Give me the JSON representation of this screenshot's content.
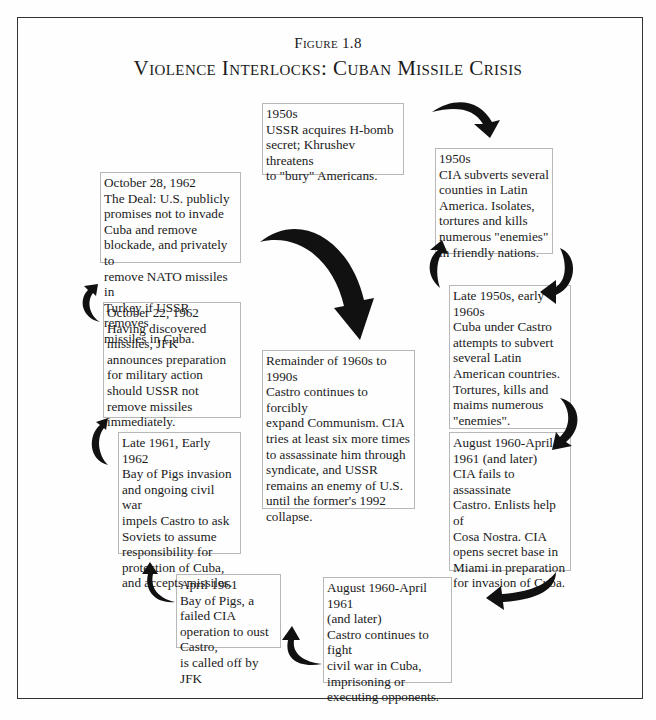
{
  "figure": {
    "label": "Figure 1.8",
    "title": "Violence Interlocks: Cuban Missile Crisis"
  },
  "events": [
    {
      "id": "ussr-1950s",
      "date": "1950s",
      "text": "USSR acquires H-bomb\nsecret; Khrushev threatens\nto \"bury\" Americans."
    },
    {
      "id": "cia-1950s",
      "date": "1950s",
      "text": "CIA subverts several\ncounties in Latin\nAmerica.  Isolates,\ntortures and kills\nnumerous \"enemies\"\nin friendly nations."
    },
    {
      "id": "cuba-late-1950s",
      "date": "Late 1950s, early\n1960s",
      "text": "Cuba under Castro\nattempts to subvert\nseveral Latin\nAmerican countries.\nTortures, kills and\nmaims numerous\n\"enemies\"."
    },
    {
      "id": "cia-aug-1960",
      "date": "August 1960-April\n1961  (and later)",
      "text": "CIA fails to assassinate\nCastro.  Enlists help of\nCosa Nostra.  CIA\nopens secret base in\nMiami in preparation\nfor invasion of Cuba."
    },
    {
      "id": "castro-aug-1960",
      "date": "August 1960-April 1961\n(and later)",
      "text": "Castro continues to fight\ncivil war in Cuba,\nimprisoning or\nexecuting  opponents."
    },
    {
      "id": "april-1961",
      "date": "April 1961",
      "text": "Bay of Pigs, a failed CIA\noperation to oust Castro,\nis called off by JFK"
    },
    {
      "id": "late-1961",
      "date": "Late 1961, Early 1962",
      "text": "Bay of Pigs invasion\nand ongoing civil war\nimpels Castro to ask\nSoviets to assume\nresponsibility for\nprotection of Cuba,\nand accepts missiles."
    },
    {
      "id": "oct-22-1962",
      "date": "October 22, 1962",
      "text": "Having discovered\nmissiles, JFK\nannounces preparation\nfor military action\nshould USSR not\nremove missiles\nimmediately."
    },
    {
      "id": "oct-28-1962",
      "date": "October 28, 1962",
      "text": "The Deal:  U.S. publicly\npromises not to invade\nCuba and remove\nblockade, and privately to\nremove NATO missiles in\nTurkey if USSR removes\nmissiles in Cuba."
    },
    {
      "id": "remainder",
      "date": "Remainder of 1960s to\n1990s",
      "text": "Castro continues to forcibly\nexpand Communism.  CIA\ntries at least six more times\nto assassinate him through\nsyndicate, and USSR\nremains an enemy of U.S.\nuntil the former's 1992\ncollapse."
    }
  ],
  "flow": [
    "ussr-1950s",
    "cia-1950s",
    "cuba-late-1950s",
    "cia-aug-1960",
    "castro-aug-1960",
    "april-1961",
    "late-1961",
    "oct-22-1962",
    "oct-28-1962",
    "remainder"
  ],
  "colors": {
    "arrow": "#111111",
    "box_border": "#b8b8b8",
    "frame": "#333333",
    "text": "#1a1a1a"
  }
}
